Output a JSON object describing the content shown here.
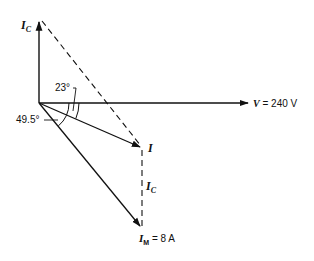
{
  "diagram": {
    "origin": [
      39,
      103
    ],
    "vectors": {
      "V": {
        "label_var": "V",
        "label_eq": " = 240 V",
        "value": "240 V",
        "angle_deg": 0,
        "tip": [
          250,
          103
        ]
      },
      "Ic_vertical": {
        "label_main": "I",
        "label_sub": "C",
        "tip": [
          39,
          20
        ]
      },
      "I": {
        "label": "I",
        "angle_deg": -23,
        "tip": [
          142,
          148
        ]
      },
      "Im": {
        "label_main": "I",
        "label_sub": "M",
        "label_eq": " = 8 A",
        "value": "8 A",
        "angle_deg": -49.5,
        "tip": [
          142,
          228
        ]
      }
    },
    "dashed_lines": {
      "ic_tip_to_i": {
        "from": [
          39,
          20
        ],
        "to": [
          142,
          148
        ]
      },
      "ic_parallel": {
        "from": [
          142,
          150
        ],
        "to": [
          142,
          226
        ],
        "label_main": "I",
        "label_sub": "C"
      }
    },
    "angles": {
      "a23": {
        "label": "23°",
        "value": 23
      },
      "a49": {
        "label": "49.5°",
        "value": 49.5
      }
    },
    "colors": {
      "ink": "#111111",
      "background": "#ffffff"
    }
  }
}
